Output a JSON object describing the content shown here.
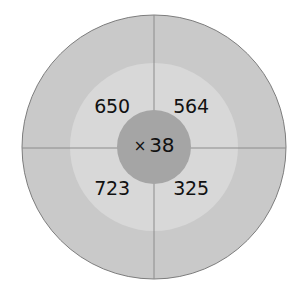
{
  "diagram": {
    "type": "multiplication-wheel",
    "center": {
      "operator": "×",
      "multiplier": "38"
    },
    "quadrants": [
      {
        "position": "top-left",
        "value": "650"
      },
      {
        "position": "top-right",
        "value": "564"
      },
      {
        "position": "bottom-left",
        "value": "723"
      },
      {
        "position": "bottom-right",
        "value": "325"
      }
    ],
    "colors": {
      "outer_ring": "#c9c9c9",
      "middle_ring": "#d8d8d8",
      "inner_circle": "#a5a5a5",
      "divider_lines": "#8c8c8c",
      "outline": "#7d7d7d",
      "text": "#111111"
    }
  }
}
